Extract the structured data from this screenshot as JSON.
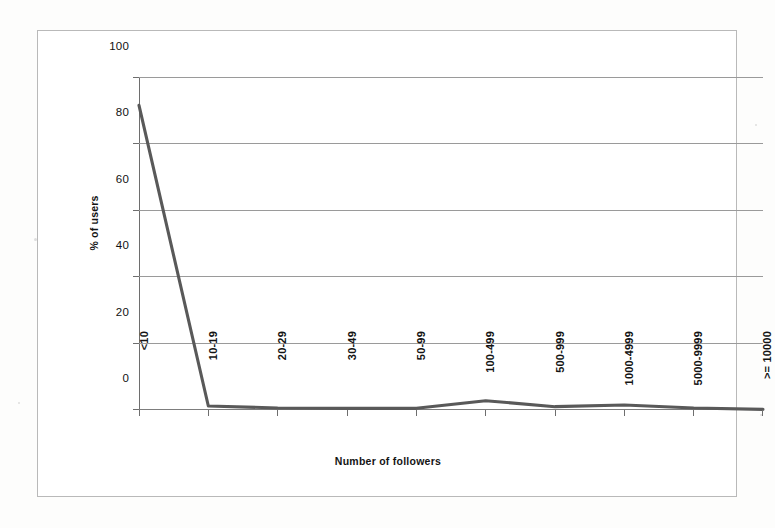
{
  "chart_data": {
    "type": "line",
    "title": "",
    "subtitle": "",
    "xlabel": "Number of followers",
    "ylabel": "% of users",
    "categories": [
      "<10",
      "10-19",
      "20-29",
      "30-49",
      "50-99",
      "100-499",
      "500-999",
      "1000-4999",
      "5000-9999",
      ">= 10000"
    ],
    "series": [
      {
        "name": "% of users",
        "values": [
          91.5,
          1.2,
          0.6,
          0.5,
          0.5,
          2.8,
          1.0,
          1.5,
          0.6,
          0.2
        ],
        "color": "#595959"
      }
    ],
    "ylim": [
      0,
      100
    ],
    "yticks": [
      0,
      20,
      40,
      60,
      80,
      100
    ],
    "ytick_labels": [
      "0",
      "20",
      "40",
      "60",
      "80",
      "100"
    ],
    "grid": "horizontal",
    "legend": "none",
    "markers": "none"
  },
  "figure": {
    "background_color": "#fdfdfc",
    "plot_background_color": "#ffffff",
    "frame_color": "#b9b9b9",
    "gridline_color": "#9a9a9a",
    "axis_color": "#6e6e6e",
    "line_color": "#595959",
    "text_color": "#141414"
  }
}
